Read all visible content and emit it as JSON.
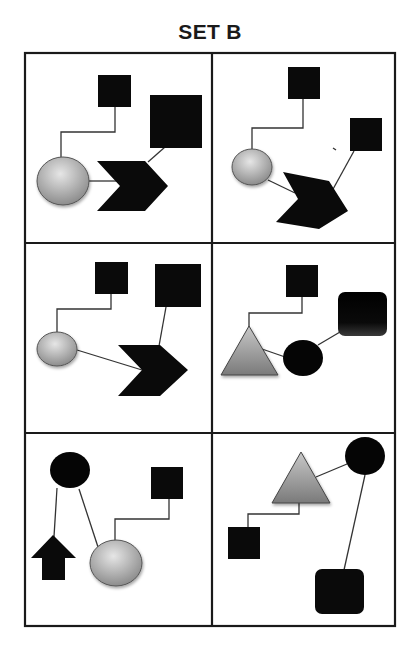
{
  "title": "SET B",
  "grid": {
    "rows": 3,
    "cols": 2,
    "border_color": "#1a1a1a"
  },
  "colors": {
    "black_shape": "#0a0a0a",
    "gray_shape_light": "#d8d8d8",
    "gray_shape_dark": "#8a8a8a",
    "connector": "#333333"
  },
  "cells": [
    {
      "id": 1,
      "shapes": [
        "small-square",
        "large-square",
        "gray-circle",
        "black-chevron"
      ]
    },
    {
      "id": 2,
      "shapes": [
        "small-square",
        "small-square",
        "gray-circle",
        "black-chevron-rotated"
      ]
    },
    {
      "id": 3,
      "shapes": [
        "small-square",
        "large-square",
        "gray-circle",
        "black-chevron"
      ]
    },
    {
      "id": 4,
      "shapes": [
        "small-square",
        "rounded-square",
        "gray-triangle",
        "black-circle"
      ]
    },
    {
      "id": 5,
      "shapes": [
        "black-circle",
        "black-arrow-up",
        "gray-circle",
        "small-square"
      ]
    },
    {
      "id": 6,
      "shapes": [
        "gray-triangle",
        "black-circle",
        "small-square",
        "rounded-square"
      ]
    }
  ]
}
